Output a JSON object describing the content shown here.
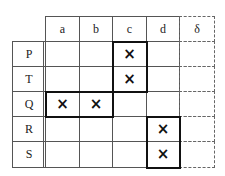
{
  "columns": [
    "a",
    "b",
    "c",
    "d",
    "δ"
  ],
  "rows": [
    {
      "label": "P",
      "marks": [
        "",
        "",
        "×",
        "",
        ""
      ]
    },
    {
      "label": "T",
      "marks": [
        "",
        "",
        "×",
        "",
        ""
      ]
    },
    {
      "label": "Q",
      "marks": [
        "×",
        "×",
        "",
        "",
        ""
      ]
    },
    {
      "label": "R",
      "marks": [
        "",
        "",
        "",
        "×",
        ""
      ]
    },
    {
      "label": "S",
      "marks": [
        "",
        "",
        "",
        "×",
        ""
      ]
    }
  ],
  "groups": [
    {
      "name": "group-c-PT",
      "columns": [
        "c"
      ],
      "rows": [
        "P",
        "T"
      ]
    },
    {
      "name": "group-ab-Q",
      "columns": [
        "a",
        "b"
      ],
      "rows": [
        "Q"
      ]
    },
    {
      "name": "group-d-RS",
      "columns": [
        "d"
      ],
      "rows": [
        "R",
        "S"
      ]
    }
  ],
  "dashed_column": "δ"
}
